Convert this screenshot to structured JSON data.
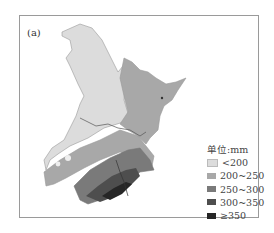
{
  "panel_label": "(a)",
  "legend": {
    "title": "单位:mm",
    "items": [
      {
        "label": "<200",
        "color": "#dcdcdc"
      },
      {
        "label": "200~250",
        "color": "#a8a8a8"
      },
      {
        "label": "250~300",
        "color": "#7a7a7a"
      },
      {
        "label": "300~350",
        "color": "#4e4e4e"
      },
      {
        "label": "≥350",
        "color": "#262626"
      }
    ]
  },
  "colors": {
    "frame": "#9a9a9a",
    "boundary": "#555555"
  }
}
